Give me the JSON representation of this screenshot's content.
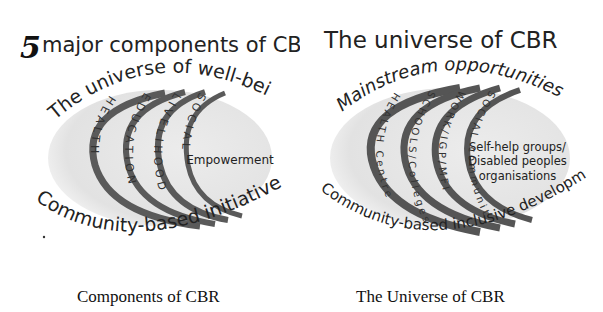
{
  "left_diagram": {
    "title_number": "5",
    "title_text": "major components of CBR",
    "top_arc_text": "The universe of well-being",
    "bottom_arc_text": "Community-based initiatives",
    "bands": [
      {
        "label": "HEALTH"
      },
      {
        "label": "EDUCATION"
      },
      {
        "label": "LIVELIHOOD"
      },
      {
        "label": "SOCIAL"
      }
    ],
    "core_label": "Empowerment",
    "caption": "Components of CBR"
  },
  "right_diagram": {
    "title_text": "The universe of CBR",
    "top_arc_text": "Mainstream opportunities",
    "bottom_arc_text": "Community-based inclusive development",
    "bands": [
      {
        "label": "HEALTH Centre"
      },
      {
        "label": "SCHOOLS/Colleges"
      },
      {
        "label": "WORK/IGP/MFI"
      },
      {
        "label": "SOCIAL community"
      }
    ],
    "core_label_lines": [
      "Self-help groups/",
      "Disabled peoples",
      "organisations"
    ],
    "caption": "The Universe of CBR"
  },
  "colors": {
    "ellipse_fill": "#e6e6e6",
    "band_stroke": "#555555",
    "text": "#222222",
    "background": "#ffffff"
  }
}
